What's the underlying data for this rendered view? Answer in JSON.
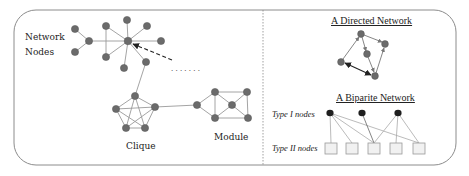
{
  "labels": {
    "network_nodes_line1": "Network",
    "network_nodes_line2": "Nodes",
    "clique": "Clique",
    "module": "Module",
    "directed_title": "A Directed Network",
    "biparite_title": "A Biparite Network",
    "type1": "Type I nodes",
    "type2": "Type II nodes",
    "ellipsis": ". . .   . . . ."
  },
  "colors": {
    "node": "#6b6b6b",
    "node_stroke": "#555555",
    "edge": "#9a9a9a",
    "dark_node": "#1e1e1e",
    "frame": "#8c8c8c",
    "square_fill": "#f1f1f1",
    "square_stroke": "#9a9a9a"
  }
}
